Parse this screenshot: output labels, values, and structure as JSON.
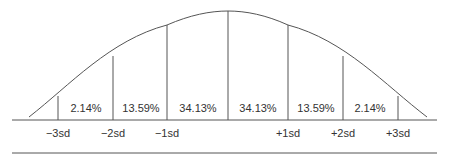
{
  "diagram": {
    "line_color": "#555555",
    "segments": [
      {
        "label": "2.14%",
        "x": 86
      },
      {
        "label": "13.59%",
        "x": 141
      },
      {
        "label": "34.13%",
        "x": 198
      },
      {
        "label": "34.13%",
        "x": 258
      },
      {
        "label": "13.59%",
        "x": 316
      },
      {
        "label": "2.14%",
        "x": 370
      }
    ],
    "sd_labels": [
      {
        "label": "−3sd",
        "x": 58
      },
      {
        "label": "−2sd",
        "x": 113
      },
      {
        "label": "−1sd",
        "x": 167
      },
      {
        "label": "+1sd",
        "x": 288
      },
      {
        "label": "+2sd",
        "x": 343
      },
      {
        "label": "+3sd",
        "x": 398
      }
    ]
  }
}
